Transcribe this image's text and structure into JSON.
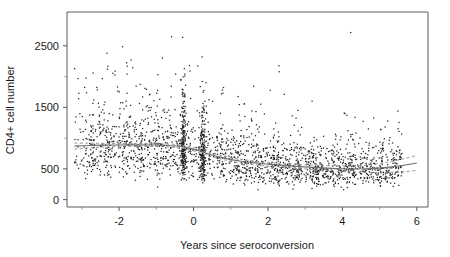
{
  "chart_data": {
    "type": "scatter",
    "title": "",
    "subtitle": "",
    "xlabel": "Years since seroconversion",
    "ylabel": "CD4+ cell number",
    "xlim": [
      -3.4,
      6.3
    ],
    "ylim": [
      -120,
      3050
    ],
    "xticks": [
      -2,
      0,
      2,
      4,
      6
    ],
    "xtick_labels": [
      "-2",
      "0",
      "2",
      "4",
      "6"
    ],
    "yticks": [
      0,
      500,
      1500,
      2500
    ],
    "ytick_labels": [
      "0",
      "500",
      "1500",
      "2500"
    ],
    "yticks_minor": [
      1000,
      2000
    ],
    "grid": false,
    "legend": null,
    "legend_position": "none",
    "marker": {
      "shape": "dot",
      "size": 1.1,
      "color": "#202020"
    },
    "annotations": [],
    "series": [
      {
        "name": "CD4+ cell counts",
        "type": "scatter",
        "n_points": 2376,
        "description": "Longitudinal CD4+ cell counts of seroconverters plotted against years since seroconversion; dense vertical bands of repeated visit times near -0.27 and 0.25 years.",
        "x_range": [
          -3.2,
          5.6
        ],
        "y_range": [
          0,
          3000
        ]
      },
      {
        "name": "Loess fit",
        "type": "line",
        "style": "solid",
        "color": "#6e6e6e",
        "points": [
          [
            -3.2,
            870
          ],
          [
            -2.8,
            880
          ],
          [
            -2.4,
            885
          ],
          [
            -2.0,
            888
          ],
          [
            -1.6,
            890
          ],
          [
            -1.2,
            888
          ],
          [
            -0.8,
            882
          ],
          [
            -0.4,
            868
          ],
          [
            0.0,
            820
          ],
          [
            0.4,
            742
          ],
          [
            0.8,
            680
          ],
          [
            1.2,
            632
          ],
          [
            1.6,
            600
          ],
          [
            2.0,
            575
          ],
          [
            2.4,
            556
          ],
          [
            2.8,
            540
          ],
          [
            3.2,
            525
          ],
          [
            3.6,
            512
          ],
          [
            4.0,
            502
          ],
          [
            4.4,
            498
          ],
          [
            4.8,
            505
          ],
          [
            5.2,
            525
          ],
          [
            5.6,
            555
          ],
          [
            6.0,
            595
          ]
        ]
      },
      {
        "name": "Upper confidence band",
        "type": "line",
        "style": "dashed",
        "color": "#8a8a8a",
        "points": [
          [
            -3.2,
            920
          ],
          [
            -2.8,
            918
          ],
          [
            -2.4,
            915
          ],
          [
            -2.0,
            912
          ],
          [
            -1.6,
            912
          ],
          [
            -1.2,
            910
          ],
          [
            -0.8,
            905
          ],
          [
            -0.4,
            892
          ],
          [
            0.0,
            848
          ],
          [
            0.4,
            772
          ],
          [
            0.8,
            710
          ],
          [
            1.2,
            662
          ],
          [
            1.6,
            630
          ],
          [
            2.0,
            605
          ],
          [
            2.4,
            586
          ],
          [
            2.8,
            572
          ],
          [
            3.2,
            560
          ],
          [
            3.6,
            552
          ],
          [
            4.0,
            548
          ],
          [
            4.4,
            552
          ],
          [
            4.8,
            572
          ],
          [
            5.2,
            608
          ],
          [
            5.6,
            658
          ],
          [
            6.0,
            715
          ]
        ]
      },
      {
        "name": "Lower confidence band",
        "type": "line",
        "style": "dashed",
        "color": "#8a8a8a",
        "points": [
          [
            -3.2,
            820
          ],
          [
            -2.8,
            842
          ],
          [
            -2.4,
            855
          ],
          [
            -2.0,
            864
          ],
          [
            -1.6,
            868
          ],
          [
            -1.2,
            866
          ],
          [
            -0.8,
            859
          ],
          [
            -0.4,
            844
          ],
          [
            0.0,
            792
          ],
          [
            0.4,
            712
          ],
          [
            0.8,
            650
          ],
          [
            1.2,
            602
          ],
          [
            1.6,
            570
          ],
          [
            2.0,
            545
          ],
          [
            2.4,
            526
          ],
          [
            2.8,
            508
          ],
          [
            3.2,
            490
          ],
          [
            3.6,
            472
          ],
          [
            4.0,
            456
          ],
          [
            4.4,
            444
          ],
          [
            4.8,
            438
          ],
          [
            5.2,
            442
          ],
          [
            5.6,
            452
          ],
          [
            6.0,
            475
          ]
        ]
      }
    ]
  },
  "axes": {
    "x_axis_name": "Years since seroconversion",
    "y_axis_name": "CD4+ cell number"
  }
}
